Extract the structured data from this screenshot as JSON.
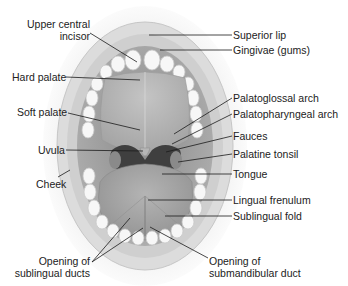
{
  "diagram": {
    "labels_left": [
      {
        "id": "upper-central-incisor",
        "text": "Upper central\nincisor",
        "line1": "Upper central",
        "line2": "incisor"
      },
      {
        "id": "hard-palate",
        "text": "Hard palate"
      },
      {
        "id": "soft-palate",
        "text": "Soft palate"
      },
      {
        "id": "uvula",
        "text": "Uvula"
      },
      {
        "id": "cheek",
        "text": "Cheek"
      },
      {
        "id": "opening-of-sublingual-ducts",
        "line1": "Opening of",
        "line2": "sublingual ducts"
      }
    ],
    "labels_right": [
      {
        "id": "superior-lip",
        "text": "Superior lip"
      },
      {
        "id": "gingivae",
        "text": "Gingivae (gums)"
      },
      {
        "id": "palatoglossal-arch",
        "text": "Palatoglossal arch"
      },
      {
        "id": "palatopharyngeal-arch",
        "text": "Palatopharyngeal arch"
      },
      {
        "id": "fauces",
        "text": "Fauces"
      },
      {
        "id": "palatine-tonsil",
        "text": "Palatine tonsil"
      },
      {
        "id": "tongue",
        "text": "Tongue"
      },
      {
        "id": "lingual-frenulum",
        "text": "Lingual frenulum"
      },
      {
        "id": "sublingual-fold",
        "text": "Sublingual fold"
      },
      {
        "id": "opening-of-submandibular-duct",
        "line1": "Opening of",
        "line2": "submandibular duct"
      }
    ],
    "colors": {
      "skin": "#e6e6e6",
      "lip": "#d4d4d4",
      "cavity": "#9a9a9a",
      "palate": "#b8b8b8",
      "pharynx": "#3c3c3c",
      "tongue": "#a8a8a8",
      "teeth": "#f6f6f6",
      "leader": "#1a1a1a",
      "text": "#222222"
    }
  }
}
